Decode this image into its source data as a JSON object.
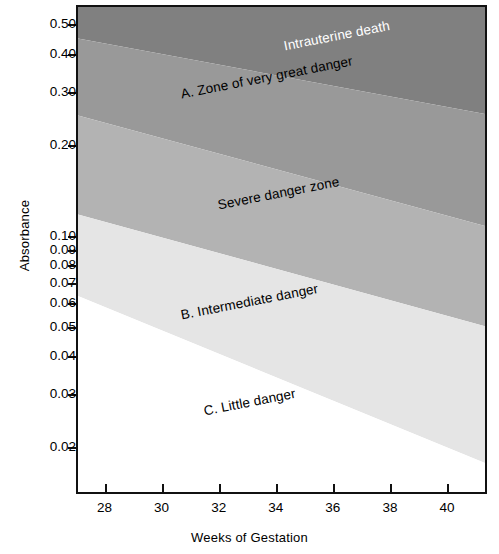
{
  "chart_data": {
    "type": "area",
    "title": "",
    "xlabel": "Weeks of Gestation",
    "ylabel": "Absorbance",
    "xlim": [
      27.0,
      41.4
    ],
    "ylim": [
      0.014,
      0.58
    ],
    "yscale": "log",
    "xscale": "linear",
    "grid": false,
    "legend": "none",
    "xticks": [
      28,
      30,
      32,
      34,
      36,
      38,
      40
    ],
    "xtick_labels": [
      "28",
      "30",
      "32",
      "34",
      "36",
      "38",
      "40"
    ],
    "yticks": [
      0.02,
      0.03,
      0.04,
      0.05,
      0.06,
      0.07,
      0.08,
      0.09,
      0.1,
      0.2,
      0.3,
      0.4,
      0.5
    ],
    "ytick_labels": [
      "0.02",
      "0.03",
      "0.04",
      "0.05",
      "0.06",
      "0.07",
      "0.08",
      "0.09",
      "0.10",
      "0.20",
      "0.30",
      "0.40",
      "0.50"
    ],
    "bands": [
      {
        "name": "Intrauterine death",
        "color": "#808080",
        "label_color": "#ffffff",
        "lower_boundary": {
          "x": [
            27.0,
            41.4
          ],
          "y": [
            0.455,
            0.255
          ]
        },
        "upper_boundary": {
          "x": [
            27.0,
            41.4
          ],
          "y": [
            0.58,
            0.58
          ]
        }
      },
      {
        "name": "A. Zone of very great danger",
        "color": "#999999",
        "label_color": "#000000",
        "lower_boundary": {
          "x": [
            27.0,
            41.4
          ],
          "y": [
            0.252,
            0.108
          ]
        },
        "upper_boundary": {
          "x": [
            27.0,
            41.4
          ],
          "y": [
            0.455,
            0.255
          ]
        }
      },
      {
        "name": "Severe danger zone",
        "color": "#b3b3b3",
        "label_color": "#000000",
        "lower_boundary": {
          "x": [
            27.0,
            41.4
          ],
          "y": [
            0.118,
            0.05
          ]
        },
        "upper_boundary": {
          "x": [
            27.0,
            41.4
          ],
          "y": [
            0.252,
            0.108
          ]
        }
      },
      {
        "name": "B. Intermediate danger",
        "color": "#e5e5e5",
        "label_color": "#000000",
        "lower_boundary": {
          "x": [
            27.0,
            41.4
          ],
          "y": [
            0.063,
            0.0175
          ]
        },
        "upper_boundary": {
          "x": [
            27.0,
            41.4
          ],
          "y": [
            0.118,
            0.05
          ]
        }
      },
      {
        "name": "C. Little danger",
        "color": "#ffffff",
        "label_color": "#000000",
        "lower_boundary": {
          "x": [
            27.0,
            41.4
          ],
          "y": [
            0.014,
            0.014
          ]
        },
        "upper_boundary": {
          "x": [
            27.0,
            41.4
          ],
          "y": [
            0.063,
            0.0175
          ]
        }
      }
    ],
    "annotations": [
      {
        "text": "Intrauterine death",
        "x": 34.2,
        "y": 0.43,
        "rotation": -11,
        "color": "#ffffff"
      },
      {
        "text": "A. Zone of very great danger",
        "x": 30.6,
        "y": 0.3,
        "rotation": -11,
        "color": "#000000"
      },
      {
        "text": "Severe danger zone",
        "x": 31.9,
        "y": 0.128,
        "rotation": -11,
        "color": "#000000"
      },
      {
        "text": "B. Intermediate danger",
        "x": 30.6,
        "y": 0.0555,
        "rotation": -11,
        "color": "#000000"
      },
      {
        "text": "C. Little danger",
        "x": 31.4,
        "y": 0.0268,
        "rotation": -11,
        "color": "#000000"
      }
    ]
  },
  "axes": {
    "y_title": "Absorbance",
    "x_title": "Weeks of Gestation"
  }
}
